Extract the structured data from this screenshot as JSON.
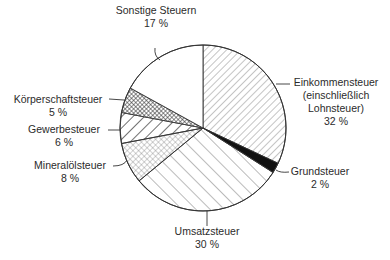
{
  "chart_data": {
    "type": "pie",
    "title": "",
    "start_angle": "12 o'clock",
    "direction": "clockwise",
    "slices": [
      {
        "label": "Einkommensteuer (einschließlich Lohnsteuer)",
        "value": 32,
        "pattern": "diagonal-hatch-fine"
      },
      {
        "label": "Grundsteuer",
        "value": 2,
        "pattern": "solid-black"
      },
      {
        "label": "Umsatzsteuer",
        "value": 30,
        "pattern": "diagonal-hatch-wide-reverse"
      },
      {
        "label": "Mineralölsteuer",
        "value": 8,
        "pattern": "crosshatch-light"
      },
      {
        "label": "Gewerbesteuer",
        "value": 6,
        "pattern": "diagonal-hatch-bold"
      },
      {
        "label": "Körperschaftsteuer",
        "value": 5,
        "pattern": "crosshatch-dark"
      },
      {
        "label": "Sonstige Steuern",
        "value": 17,
        "pattern": "none"
      }
    ],
    "unit": "%"
  },
  "labels": {
    "einkommen": {
      "line1": "Einkommensteuer",
      "line2": "(einschließlich",
      "line3": "Lohnsteuer)",
      "pct": "32 %"
    },
    "grund": {
      "line1": "Grundsteuer",
      "pct": "2 %"
    },
    "umsatz": {
      "line1": "Umsatzsteuer",
      "pct": "30 %"
    },
    "mineral": {
      "line1": "Mineralölsteuer",
      "pct": "8 %"
    },
    "gewerbe": {
      "line1": "Gewerbesteuer",
      "pct": "6 %"
    },
    "koerper": {
      "line1": "Körperschaftsteuer",
      "pct": "5 %"
    },
    "sonstige": {
      "line1": "Sonstige Steuern",
      "pct": "17 %"
    }
  }
}
